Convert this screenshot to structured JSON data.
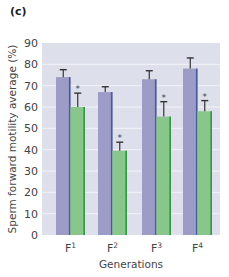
{
  "panel_label": "(c)",
  "chart_data": {
    "type": "bar",
    "title": "",
    "xlabel": "Generations",
    "ylabel": "Sperm forward motility average (%)",
    "ylim": [
      0,
      90
    ],
    "yticks": [
      0,
      10,
      20,
      30,
      40,
      50,
      60,
      70,
      80,
      90
    ],
    "grid": true,
    "legend": null,
    "categories": [
      {
        "base": "F",
        "sup": "1"
      },
      {
        "base": "F",
        "sup": "2"
      },
      {
        "base": "F",
        "sup": "3"
      },
      {
        "base": "F",
        "sup": "4"
      }
    ],
    "series": [
      {
        "name": "Control",
        "color": "#9d9cc6",
        "edge": "#4a5aa0",
        "values": [
          74,
          67,
          73,
          78
        ],
        "error_upper": [
          77.5,
          69.5,
          77,
          83
        ],
        "significant": [
          false,
          false,
          false,
          false
        ]
      },
      {
        "name": "Treated",
        "color": "#88c68c",
        "edge": "#2e9a3e",
        "values": [
          60,
          39.5,
          55.5,
          58
        ],
        "error_upper": [
          66.5,
          43.5,
          62.5,
          63
        ],
        "significant": [
          true,
          true,
          true,
          true
        ]
      }
    ],
    "significance_marker": "*"
  },
  "colors": {
    "plot_background": "#dde0eb",
    "gridline": "#f2f3f7"
  }
}
